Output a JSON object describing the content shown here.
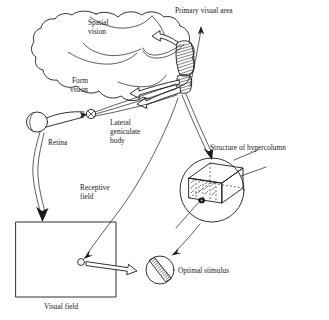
{
  "figure": {
    "background_color": "#ffffff",
    "ink_color": "#1a1a1a",
    "width": 329,
    "height": 320
  },
  "labels": {
    "primary_visual_area": "Primary visual area",
    "spatial_vision_line1": "Spatial",
    "spatial_vision_line2": "vision",
    "form_vision_line1": "Form",
    "form_vision_line2": "vision",
    "lateral_geniculate_line1": "Lateral",
    "lateral_geniculate_line2": "geniculate",
    "lateral_geniculate_line3": "body",
    "retina": "Retina",
    "receptive_field_line1": "Receptive",
    "receptive_field_line2": "field",
    "visual_field": "Visual field",
    "structure_of_hypercolumn": "Structure of hypercolumn",
    "optimal_stimulus": "Optimal stimulus"
  },
  "structures": {
    "brain_outline": "cerebral-cortex-lateral-view",
    "striate_cortex": "hatched-band-primary-visual-area",
    "eyeball": "retina-eye-oval",
    "optic_chiasm": "crossed-circle-lateral-geniculate-body",
    "visual_field_box": "rectangle",
    "receptive_field_marker": "small-open-circle",
    "hypercolumn_circle": "magnified-circle-with-3d-block",
    "optimal_stimulus_circle": "circle-with-diagonal-hatched-bar"
  },
  "arrows": {
    "retina_to_visual_field": "curved-arrow-down",
    "cortex_to_receptive_field": "long-curve-to-receptive-field",
    "cortex_to_hypercolumn": "double-line-arrow-down-right",
    "hypercolumn_to_optimal_stimulus": "arrow-down-left",
    "receptive_field_to_optimal_stimulus": "hollow-bar-arrow-right",
    "primary_visual_area_pointer": "arrow-up",
    "spatial_vision_block_arrow": "hollow-block-arrow-up-left",
    "form_vision_block_arrow": "hollow-block-arrow-left"
  }
}
